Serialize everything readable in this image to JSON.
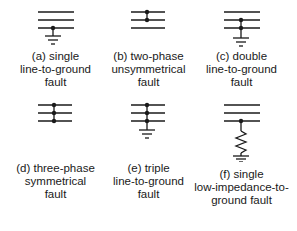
{
  "figure": {
    "panels": [
      {
        "id": "a",
        "caption": [
          "(a) single",
          "line-to-ground",
          "fault"
        ]
      },
      {
        "id": "b",
        "caption": [
          "(b) two-phase",
          "unsymmetrical",
          "fault"
        ]
      },
      {
        "id": "c",
        "caption": [
          "(c) double",
          "line-to-ground",
          "fault"
        ]
      },
      {
        "id": "d",
        "caption": [
          "(d) three-phase",
          "symmetrical",
          "fault"
        ]
      },
      {
        "id": "e",
        "caption": [
          "(e) triple",
          "line-to-ground",
          "fault"
        ]
      },
      {
        "id": "f",
        "caption": [
          "(f) single",
          "low-impedance-to-",
          "ground fault"
        ]
      }
    ],
    "colors": {
      "line": "#1a1a1a",
      "background": "#ffffff"
    }
  }
}
